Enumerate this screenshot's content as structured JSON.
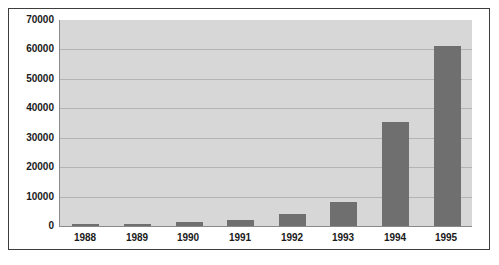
{
  "chart_data": {
    "type": "bar",
    "title": "",
    "xlabel": "",
    "ylabel": "",
    "categories": [
      "1988",
      "1989",
      "1990",
      "1991",
      "1992",
      "1993",
      "1994",
      "1995"
    ],
    "values": [
      300,
      500,
      1500,
      2200,
      4000,
      8200,
      35500,
      61000
    ],
    "series": [
      {
        "name": "",
        "values": [
          300,
          500,
          1500,
          2200,
          4000,
          8200,
          35500,
          61000
        ]
      }
    ],
    "ylim": [
      0,
      70000
    ],
    "ytick_step": 10000,
    "yticks": [
      "70000",
      "60000",
      "50000",
      "40000",
      "30000",
      "20000",
      "10000",
      "0"
    ],
    "ytick_values": [
      70000,
      60000,
      50000,
      40000,
      30000,
      20000,
      10000,
      0
    ],
    "grid": "horizontal",
    "legend": "none",
    "colors": {
      "bar": "#6f6f6f",
      "plot_background": "#d7d7d7",
      "figure_background": "#ffffff",
      "gridline": "#b3b3b3",
      "axis": "#8a8a8a",
      "frame": "#3d3d3d",
      "text": "#1a1a1a"
    }
  }
}
